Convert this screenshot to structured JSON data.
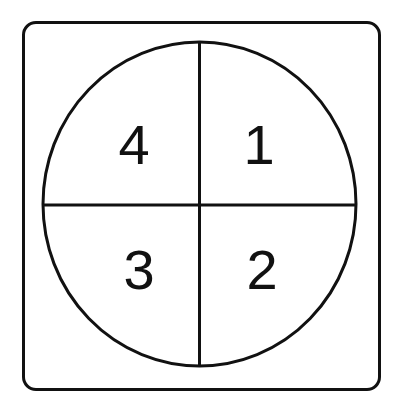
{
  "diagram": {
    "title": "",
    "shape": "circle divided into four quadrants",
    "stroke_color": "#111111",
    "background": "#ffffff",
    "quadrants": [
      {
        "position": "top-right",
        "label": "1"
      },
      {
        "position": "bottom-right",
        "label": "2"
      },
      {
        "position": "bottom-left",
        "label": "3"
      },
      {
        "position": "top-left",
        "label": "4"
      }
    ]
  }
}
